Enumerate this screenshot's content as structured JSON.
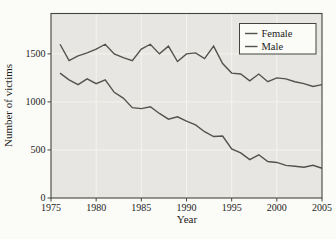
{
  "figure": {
    "colors": {
      "outer_bg": "#fbfbf8",
      "plot_bg": "#e7e6e2",
      "grid": "#f4f3ef",
      "frame": "#45453f",
      "tick": "#45453f",
      "text": "#1d1d1a",
      "female_line": "#53524d",
      "male_line": "#53524d",
      "legend_bg": "#fbfbf8",
      "legend_border": "#45453f"
    }
  },
  "chart_data": {
    "type": "line",
    "title": "",
    "xlabel": "Year",
    "ylabel": "Number of victims",
    "x": [
      1976,
      1977,
      1978,
      1979,
      1980,
      1981,
      1982,
      1983,
      1984,
      1985,
      1986,
      1987,
      1988,
      1989,
      1990,
      1991,
      1992,
      1993,
      1994,
      1995,
      1996,
      1997,
      1998,
      1999,
      2000,
      2001,
      2002,
      2003,
      2004,
      2005
    ],
    "series": [
      {
        "name": "Female",
        "values": [
          1600,
          1430,
          1480,
          1510,
          1550,
          1600,
          1500,
          1460,
          1430,
          1550,
          1600,
          1500,
          1580,
          1420,
          1500,
          1510,
          1450,
          1580,
          1400,
          1300,
          1290,
          1220,
          1290,
          1210,
          1250,
          1240,
          1210,
          1190,
          1160,
          1180
        ]
      },
      {
        "name": "Male",
        "values": [
          1300,
          1230,
          1180,
          1240,
          1190,
          1230,
          1100,
          1040,
          940,
          930,
          950,
          880,
          820,
          845,
          800,
          760,
          690,
          640,
          645,
          510,
          470,
          400,
          450,
          380,
          370,
          340,
          330,
          320,
          340,
          310
        ]
      }
    ],
    "xlim": [
      1975,
      2005
    ],
    "ylim": [
      0,
      1920
    ],
    "xticks": [
      1975,
      1980,
      1985,
      1990,
      1995,
      2000,
      2005
    ],
    "yticks": [
      0,
      500,
      1000,
      1500
    ],
    "grid": true,
    "legend_position": "top-right"
  }
}
